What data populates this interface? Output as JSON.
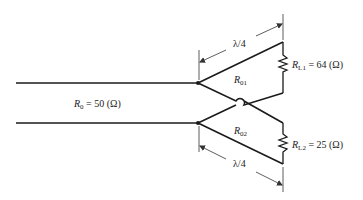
{
  "diagram": {
    "source_line": {
      "label_symbol": "R",
      "label_sub": "0",
      "label_value": " = 50 (Ω)"
    },
    "branch_upper": {
      "length_label": "λ/4",
      "impedance_symbol": "R",
      "impedance_sub": "01",
      "impedance_prime": "′",
      "load_symbol": "R",
      "load_sub": "L1",
      "load_value": " = 64 (Ω)"
    },
    "branch_lower": {
      "length_label": "λ/4",
      "impedance_symbol": "R",
      "impedance_sub": "02",
      "impedance_prime": "′",
      "load_symbol": "R",
      "load_sub": "L2",
      "load_value": " = 25 (Ω)"
    },
    "colors": {
      "line": "#1a1a1a",
      "dimension": "#333333",
      "background": "#ffffff"
    }
  }
}
